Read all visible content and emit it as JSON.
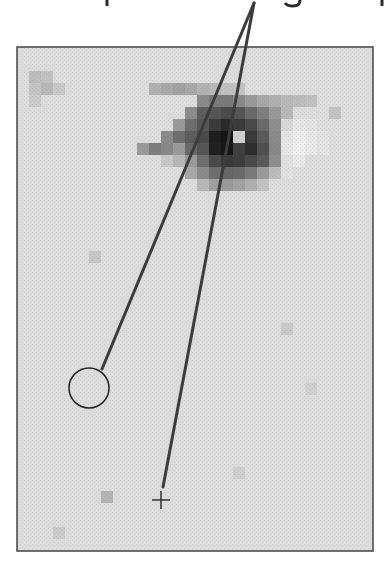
{
  "caption": {
    "visible_fragment": "",
    "note": "caption line above figure is cropped; only descenders visible"
  },
  "figure": {
    "frame": {
      "x": 17,
      "y": 47,
      "width": 356,
      "height": 504,
      "stroke": "#444444",
      "background": "#dcdcdc"
    },
    "block_size": 12,
    "eye_blocks": [
      [
        1,
        2,
        "#bdbdbd"
      ],
      [
        2,
        2,
        "#c2c2c2"
      ],
      [
        1,
        3,
        "#c4c4c4"
      ],
      [
        2,
        3,
        "#b8b8b8"
      ],
      [
        3,
        3,
        "#c8c8c8"
      ],
      [
        1,
        4,
        "#cacaca"
      ],
      [
        11,
        3,
        "#b0b0b0"
      ],
      [
        12,
        3,
        "#a8a8a8"
      ],
      [
        13,
        3,
        "#a2a2a2"
      ],
      [
        14,
        3,
        "#a8a8a8"
      ],
      [
        15,
        3,
        "#b2b2b2"
      ],
      [
        16,
        3,
        "#b8b8b8"
      ],
      [
        17,
        3,
        "#c0c0c0"
      ],
      [
        18,
        3,
        "#c2c2c2"
      ],
      [
        15,
        4,
        "#8a8a8a"
      ],
      [
        16,
        4,
        "#7a7a7a"
      ],
      [
        17,
        4,
        "#7a7a7a"
      ],
      [
        18,
        4,
        "#8a8a8a"
      ],
      [
        19,
        4,
        "#9a9a9a"
      ],
      [
        20,
        4,
        "#a8a8a8"
      ],
      [
        21,
        4,
        "#b0b0b0"
      ],
      [
        22,
        4,
        "#b8b8b8"
      ],
      [
        23,
        4,
        "#bcbcbc"
      ],
      [
        24,
        4,
        "#c0c0c0"
      ],
      [
        14,
        5,
        "#8c8c8c"
      ],
      [
        15,
        5,
        "#5e5e5e"
      ],
      [
        16,
        5,
        "#555555"
      ],
      [
        17,
        5,
        "#4a4a4a"
      ],
      [
        18,
        5,
        "#555555"
      ],
      [
        19,
        5,
        "#6a6a6a"
      ],
      [
        20,
        5,
        "#7e7e7e"
      ],
      [
        21,
        5,
        "#999999"
      ],
      [
        22,
        5,
        "#b8b8b8"
      ],
      [
        26,
        5,
        "#c2c2c2"
      ],
      [
        13,
        6,
        "#9a9a9a"
      ],
      [
        14,
        6,
        "#6e6e6e"
      ],
      [
        15,
        6,
        "#555555"
      ],
      [
        16,
        6,
        "#3a3a3a"
      ],
      [
        17,
        6,
        "#2a2a2a"
      ],
      [
        18,
        6,
        "#3a3a3a"
      ],
      [
        19,
        6,
        "#4a4a4a"
      ],
      [
        20,
        6,
        "#6a6a6a"
      ],
      [
        21,
        6,
        "#8e8e8e"
      ],
      [
        22,
        6,
        "#d8d8d8"
      ],
      [
        23,
        6,
        "#e6e6e6"
      ],
      [
        24,
        6,
        "#e2e2e2"
      ],
      [
        12,
        7,
        "#8a8a8a"
      ],
      [
        13,
        7,
        "#6e6e6e"
      ],
      [
        14,
        7,
        "#5c5c5c"
      ],
      [
        15,
        7,
        "#4a4a4a"
      ],
      [
        16,
        7,
        "#1e1e1e"
      ],
      [
        17,
        7,
        "#151515"
      ],
      [
        18,
        7,
        "#d0d0d0"
      ],
      [
        19,
        7,
        "#3a3a3a"
      ],
      [
        20,
        7,
        "#5a5a5a"
      ],
      [
        21,
        7,
        "#8a8a8a"
      ],
      [
        22,
        7,
        "#e4e4e4"
      ],
      [
        23,
        7,
        "#ececec"
      ],
      [
        24,
        7,
        "#e8e8e8"
      ],
      [
        25,
        7,
        "#e2e2e2"
      ],
      [
        10,
        8,
        "#9a9a9a"
      ],
      [
        11,
        8,
        "#7e7e7e"
      ],
      [
        12,
        8,
        "#888888"
      ],
      [
        13,
        8,
        "#9a9a9a"
      ],
      [
        14,
        8,
        "#6a6a6a"
      ],
      [
        15,
        8,
        "#555555"
      ],
      [
        16,
        8,
        "#202020"
      ],
      [
        17,
        8,
        "#181818"
      ],
      [
        18,
        8,
        "#404040"
      ],
      [
        19,
        8,
        "#2e2e2e"
      ],
      [
        20,
        8,
        "#505050"
      ],
      [
        21,
        8,
        "#888888"
      ],
      [
        22,
        8,
        "#e6e6e6"
      ],
      [
        23,
        8,
        "#eeeeee"
      ],
      [
        24,
        8,
        "#e8e8e8"
      ],
      [
        25,
        8,
        "#e2e2e2"
      ],
      [
        12,
        9,
        "#c8c8c8"
      ],
      [
        13,
        9,
        "#b8b8b8"
      ],
      [
        14,
        9,
        "#9a9a9a"
      ],
      [
        15,
        9,
        "#6e6e6e"
      ],
      [
        16,
        9,
        "#4a4a4a"
      ],
      [
        17,
        9,
        "#3a3a3a"
      ],
      [
        18,
        9,
        "#3e3e3e"
      ],
      [
        19,
        9,
        "#4a4a4a"
      ],
      [
        20,
        9,
        "#5a5a5a"
      ],
      [
        21,
        9,
        "#8e8e8e"
      ],
      [
        22,
        9,
        "#e0e0e0"
      ],
      [
        23,
        9,
        "#e8e8e8"
      ],
      [
        14,
        10,
        "#a8a8a8"
      ],
      [
        15,
        10,
        "#8a8a8a"
      ],
      [
        16,
        10,
        "#6e6e6e"
      ],
      [
        17,
        10,
        "#666666"
      ],
      [
        18,
        10,
        "#6a6a6a"
      ],
      [
        19,
        10,
        "#7a7a7a"
      ],
      [
        20,
        10,
        "#9a9a9a"
      ],
      [
        21,
        10,
        "#bcbcbc"
      ],
      [
        22,
        10,
        "#e0e0e0"
      ],
      [
        15,
        11,
        "#b8b8b8"
      ],
      [
        16,
        11,
        "#a0a0a0"
      ],
      [
        17,
        11,
        "#9a9a9a"
      ],
      [
        18,
        11,
        "#a2a2a2"
      ],
      [
        19,
        11,
        "#b0b0b0"
      ],
      [
        20,
        11,
        "#c2c2c2"
      ],
      [
        6,
        17,
        "#c6c6c6"
      ],
      [
        22,
        23,
        "#cacaca"
      ],
      [
        7,
        37,
        "#b4b4b4"
      ],
      [
        18,
        35,
        "#cfcfcf"
      ],
      [
        24,
        28,
        "#d0d0d0"
      ],
      [
        3,
        40,
        "#cbcbcb"
      ]
    ],
    "callout_apex": {
      "x": 254,
      "y": 3
    },
    "callout_stroke": "#3c3c3c",
    "callout_width": 3,
    "circle_marker": {
      "cx": 89,
      "cy": 388,
      "r": 20,
      "stroke": "#222222",
      "line_end": {
        "x": 102,
        "y": 369
      }
    },
    "crosshair_marker": {
      "x": 161,
      "y": 500,
      "size": 9,
      "stroke": "#333333",
      "line_end": {
        "x": 163,
        "y": 487
      }
    }
  }
}
